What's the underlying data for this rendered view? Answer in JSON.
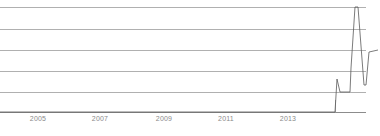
{
  "chart_data": {
    "type": "line",
    "title": "",
    "subtitle": "",
    "xlabel": "",
    "ylabel": "",
    "x_tick_labels": [
      "2005",
      "2007",
      "2009",
      "2011",
      "2013"
    ],
    "x_tick_positions_px": [
      38,
      100,
      164,
      226,
      288
    ],
    "xlim": [
      2003.8,
      2016.8
    ],
    "ylim": [
      0,
      5
    ],
    "y_gridline_values": [
      0,
      1,
      2,
      3,
      4,
      5
    ],
    "y_gridline_positions_px": [
      112,
      92,
      71,
      50,
      29,
      7
    ],
    "grid": true,
    "grid_axis": "y",
    "legend": false,
    "legend_position": "none",
    "series": [
      {
        "name": "value",
        "x": [
          2003.8,
          2014.5,
          2014.7,
          2014.95,
          2015.05,
          2015.5,
          2015.6,
          2015.75,
          2015.85,
          2016.1,
          2016.25,
          2016.45,
          2016.8
        ],
        "values": [
          0,
          0,
          1.6,
          1.0,
          1.0,
          1.0,
          2.1,
          5.0,
          5.0,
          1.3,
          1.3,
          2.6,
          3.0
        ],
        "x_px": [
          0,
          335,
          337,
          340,
          345,
          350,
          351,
          355,
          358,
          364,
          366,
          369,
          378
        ],
        "y_px": [
          112,
          112,
          79,
          92,
          92,
          92,
          68,
          7,
          7,
          85,
          85,
          52,
          50
        ],
        "color": "#595959",
        "width_px": 0.8
      }
    ]
  },
  "style": {
    "background": "#ffffff",
    "grid_color": "#b0b0b0",
    "axis_color": "#8c8c8c",
    "line_color": "#595959",
    "tick_label_color": "#8a8a8a"
  }
}
